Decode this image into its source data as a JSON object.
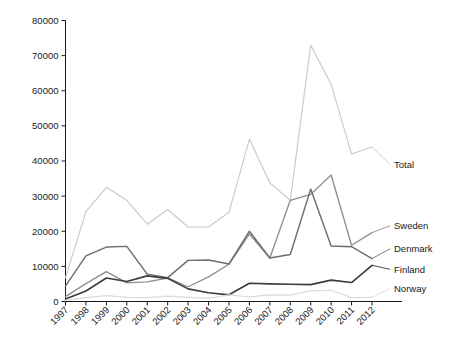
{
  "chart_data": {
    "type": "line",
    "title": "",
    "subtitle": "",
    "xlabel": "",
    "ylabel": "",
    "grid": false,
    "legend_position": "right-inline-labels",
    "categories": [
      "1997",
      "1998",
      "1999",
      "2000",
      "2001",
      "2002",
      "2003",
      "2004",
      "2005",
      "2006",
      "2007",
      "2008",
      "2009",
      "2010",
      "2011",
      "2012"
    ],
    "x": [
      1997,
      1998,
      1999,
      2000,
      2001,
      2002,
      2003,
      2004,
      2005,
      2006,
      2007,
      2008,
      2009,
      2010,
      2011,
      2012
    ],
    "xlim": [
      1997,
      2012
    ],
    "ylim": [
      0,
      80000
    ],
    "ytick_values": [
      0,
      10000,
      20000,
      30000,
      40000,
      50000,
      60000,
      70000,
      80000
    ],
    "ytick_labels": [
      "0",
      "10000",
      "20000",
      "30000",
      "40000",
      "50000",
      "60000",
      "70000",
      "80000"
    ],
    "series": [
      {
        "name": "Total",
        "color": "#c9c9c9",
        "label": "Total",
        "values": [
          6800,
          25600,
          32500,
          28800,
          22000,
          26200,
          21200,
          21200,
          25400,
          46200,
          33800,
          28800,
          73000,
          61800,
          42000,
          44000
        ]
      },
      {
        "name": "Sweden",
        "color": "#8f8f8f",
        "label": "Sweden",
        "values": [
          1400,
          5100,
          8500,
          5300,
          5600,
          6700,
          4200,
          7000,
          10600,
          19200,
          12400,
          28800,
          30500,
          36000,
          16000,
          19600
        ]
      },
      {
        "name": "Denmark",
        "color": "#6e6e6e",
        "label": "Denmark",
        "values": [
          4400,
          13000,
          15500,
          15700,
          7800,
          6800,
          11700,
          11800,
          10700,
          20000,
          12400,
          13400,
          32000,
          15800,
          15600,
          12200
        ]
      },
      {
        "name": "Finland",
        "color": "#3d3d3d",
        "label": "Finland",
        "values": [
          700,
          3000,
          6700,
          5700,
          7300,
          6600,
          3600,
          2500,
          1900,
          5200,
          5000,
          4900,
          4800,
          6100,
          5400,
          10300
        ]
      },
      {
        "name": "Norway",
        "color": "#dcdcdc",
        "label": "Norway",
        "values": [
          300,
          1100,
          1700,
          1200,
          1100,
          1500,
          1200,
          900,
          1900,
          1300,
          1900,
          1800,
          3000,
          3200,
          1100,
          1200
        ]
      }
    ],
    "series_label_order": [
      "Total",
      "Sweden",
      "Denmark",
      "Finland",
      "Norway"
    ]
  }
}
